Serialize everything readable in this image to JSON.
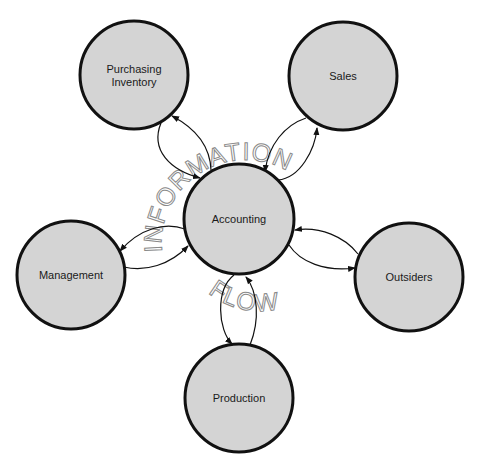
{
  "diagram": {
    "center_node": {
      "id": "accounting",
      "label": "Accounting"
    },
    "nodes": [
      {
        "id": "purchasing",
        "label_line1": "Purchasing",
        "label_line2": "Inventory"
      },
      {
        "id": "sales",
        "label": "Sales"
      },
      {
        "id": "management",
        "label": "Management"
      },
      {
        "id": "outsiders",
        "label": "Outsiders"
      },
      {
        "id": "production",
        "label": "Production"
      }
    ],
    "edges": [
      {
        "between": [
          "accounting",
          "purchasing"
        ],
        "direction": "bidirectional"
      },
      {
        "between": [
          "accounting",
          "sales"
        ],
        "direction": "bidirectional"
      },
      {
        "between": [
          "accounting",
          "management"
        ],
        "direction": "bidirectional"
      },
      {
        "between": [
          "accounting",
          "outsiders"
        ],
        "direction": "bidirectional"
      },
      {
        "between": [
          "accounting",
          "production"
        ],
        "direction": "bidirectional"
      }
    ],
    "watermark_top": "INFORMATION",
    "watermark_bottom": "FLOW",
    "colors": {
      "node_fill": "#d4d4d4",
      "node_stroke": "#111111",
      "watermark": "#8a8a8a"
    }
  }
}
